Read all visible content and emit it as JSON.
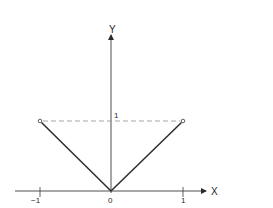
{
  "diagram": {
    "type": "function-plot",
    "axes": {
      "x_label": "X",
      "y_label": "Y",
      "x_ticks": [
        {
          "value": -1,
          "label": "−1"
        },
        {
          "value": 0,
          "label": "0"
        },
        {
          "value": 1,
          "label": "1"
        }
      ],
      "y_ticks": [
        {
          "value": 1,
          "label": "1"
        }
      ]
    },
    "segments": [
      {
        "from": [
          -1,
          1
        ],
        "to": [
          0,
          0
        ],
        "style": "solid"
      },
      {
        "from": [
          0,
          0
        ],
        "to": [
          1,
          1
        ],
        "style": "solid"
      }
    ],
    "reference_line": {
      "from": [
        -1,
        1
      ],
      "to": [
        1,
        1
      ],
      "style": "dashed"
    },
    "endpoints": [
      {
        "point": [
          -1,
          1
        ],
        "marker": "open-circle"
      },
      {
        "point": [
          1,
          1
        ],
        "marker": "open-circle"
      }
    ],
    "colors": {
      "line": "#2b2b2b",
      "dashed": "#9a9a9a",
      "background": "#ffffff"
    }
  }
}
